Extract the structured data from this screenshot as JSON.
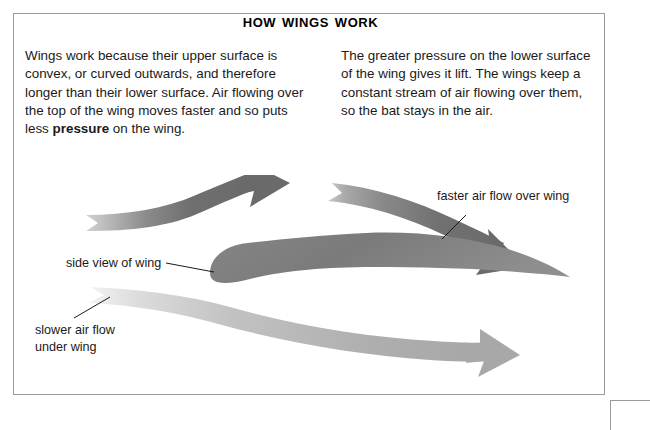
{
  "page": {
    "title": "How wings work"
  },
  "body_text": {
    "left_column": {
      "part1": "Wings work because their upper surface is convex, or curved outwards, and therefore longer than their lower surface. Air flowing over the top of the wing moves faster and so puts less ",
      "emphasis": "pressure",
      "part2": " on the wing."
    },
    "right_column": "The greater pressure on the lower surface of the wing gives it lift. The wings keep a constant stream of air flowing over them, so the bat stays in the air."
  },
  "diagram": {
    "labels": {
      "side_view_of_wing": "side view of wing",
      "faster_air_flow": "faster air flow over wing",
      "slower_air_flow_line1": "slower air flow",
      "slower_air_flow_line2": "under wing"
    },
    "colors": {
      "arrow_dark": "#6e6e6e",
      "arrow_dark_tail": "#cfcfcf",
      "arrow_light": "#b4b4b4",
      "arrow_light_tail": "#f2f2f2",
      "wing_fill": "#7b7b7b",
      "leader_line": "#1a1a1a",
      "frame_border": "#9a9a9a"
    }
  }
}
